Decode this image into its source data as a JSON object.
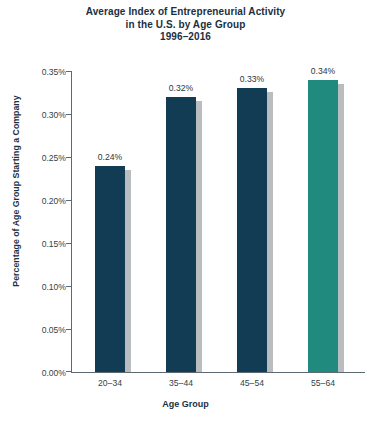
{
  "chart_data": {
    "type": "bar",
    "title": "Average Index of Entrepreneurial Activity in the U.S. by Age Group 1996–2016",
    "title_lines": [
      "Average Index of Entrepreneurial Activity",
      "in the U.S. by Age Group",
      "1996–2016"
    ],
    "categories": [
      "20–34",
      "35–44",
      "45–54",
      "55–64"
    ],
    "values": [
      0.24,
      0.32,
      0.33,
      0.34
    ],
    "value_labels": [
      "0.24%",
      "0.32%",
      "0.33%",
      "0.34%"
    ],
    "xlabel": "Age Group",
    "ylabel": "Percentage of Age Group Starting a Company",
    "ylim": [
      0,
      0.35
    ],
    "ytick_values": [
      0.0,
      0.05,
      0.1,
      0.15,
      0.2,
      0.25,
      0.3,
      0.35
    ],
    "ytick_labels": [
      "0.00%",
      "0.05%",
      "0.10%",
      "0.15%",
      "0.20%",
      "0.25%",
      "0.30%",
      "0.35%"
    ],
    "grid": false,
    "legend": false,
    "bar_colors": [
      "#123B54",
      "#123B54",
      "#123B54",
      "#1F8A7D"
    ],
    "bar_shadow_color": "#b9bdc0",
    "colors": {
      "navy": "#123B54",
      "teal": "#1F8A7D",
      "axis": "#5d6a72",
      "text": "#1b2f3f",
      "background": "#ffffff"
    }
  }
}
